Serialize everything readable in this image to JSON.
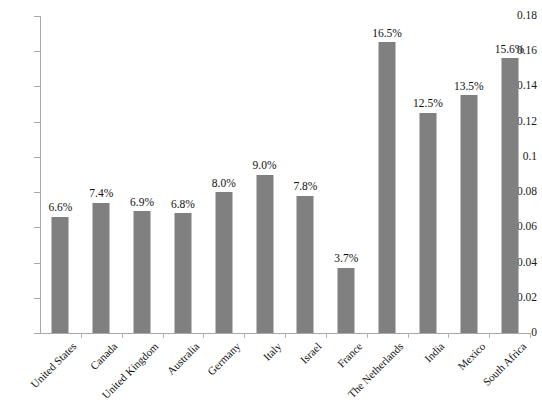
{
  "chart_data": {
    "type": "bar",
    "title": "",
    "subtitle": "",
    "xlabel": "",
    "ylabel": "",
    "ylim": [
      0,
      0.18
    ],
    "ytick_labels": [
      "0",
      "0.02",
      "0.04",
      "0.06",
      "0.08",
      "0.1",
      "0.12",
      "0.14",
      "0.16",
      "0.18"
    ],
    "ytick_values": [
      0,
      0.02,
      0.04,
      0.06,
      0.08,
      0.1,
      0.12,
      0.14,
      0.16,
      0.18
    ],
    "grid": false,
    "legend": null,
    "bar_color": "#808080",
    "axis_color": "#a8a8a8",
    "categories": [
      "United States",
      "Canada",
      "United Kingdom",
      "Australia",
      "Germany",
      "Italy",
      "Israel",
      "France",
      "The Netherlands",
      "India",
      "Mexico",
      "South Africa"
    ],
    "values": [
      0.066,
      0.074,
      0.069,
      0.068,
      0.08,
      0.09,
      0.078,
      0.037,
      0.165,
      0.125,
      0.135,
      0.156
    ],
    "data_labels": [
      "6.6%",
      "7.4%",
      "6.9%",
      "6.8%",
      "8.0%",
      "9.0%",
      "7.8%",
      "3.7%",
      "16.5%",
      "12.5%",
      "13.5%",
      "15.6%"
    ]
  }
}
